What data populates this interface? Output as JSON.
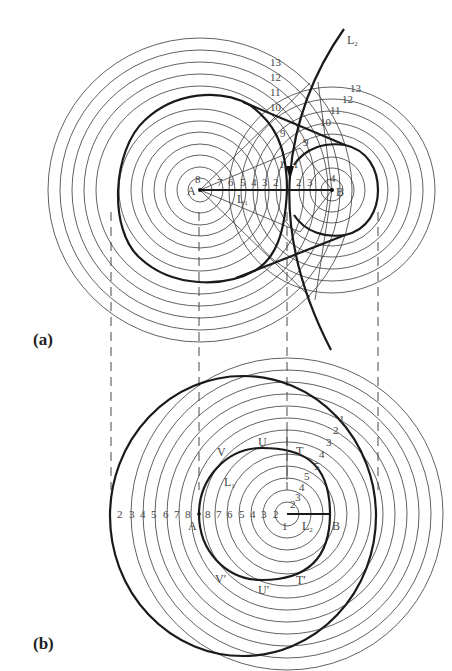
{
  "panels": {
    "a": {
      "label": "(a)",
      "points": {
        "A": "A",
        "B": "B",
        "L1": "L",
        "L1_sub": "1",
        "L2": "L",
        "L2_sub": "2"
      },
      "left_axis_numbers": [
        "8",
        "7",
        "6",
        "5",
        "4",
        "3",
        "2"
      ],
      "right_axis_numbers": [
        "2",
        "3",
        "4"
      ],
      "mid_labels": [
        "1",
        "1"
      ],
      "a_arc_labels": [
        "13",
        "12",
        "11",
        "10",
        "9"
      ],
      "b_arc_labels": [
        "13",
        "12",
        "11",
        "10",
        "9"
      ]
    },
    "b": {
      "label": "(b)",
      "points": {
        "A": "A",
        "B": "B",
        "L1": "L",
        "L1_sub": "1",
        "L2": "L",
        "L2_sub": "2",
        "V": "V",
        "U": "U",
        "T": "T",
        "V_prime": "V′",
        "U_prime": "U′",
        "T_prime": "T′"
      },
      "left_row_numbers": [
        "2",
        "3",
        "4",
        "5",
        "6",
        "7",
        "8"
      ],
      "inner_row_numbers": [
        "8",
        "7",
        "6",
        "5",
        "4",
        "3",
        "2"
      ],
      "center_labels": [
        "1",
        "2"
      ],
      "upper_right_outer": [
        "1",
        "2",
        "3",
        "4",
        "5"
      ],
      "upper_right_inner": [
        "5",
        "4",
        "3"
      ]
    }
  },
  "colors": {
    "line": "#1a1a1a",
    "thin": "#3a3a3a",
    "text": "#444444",
    "background": "#ffffff"
  }
}
